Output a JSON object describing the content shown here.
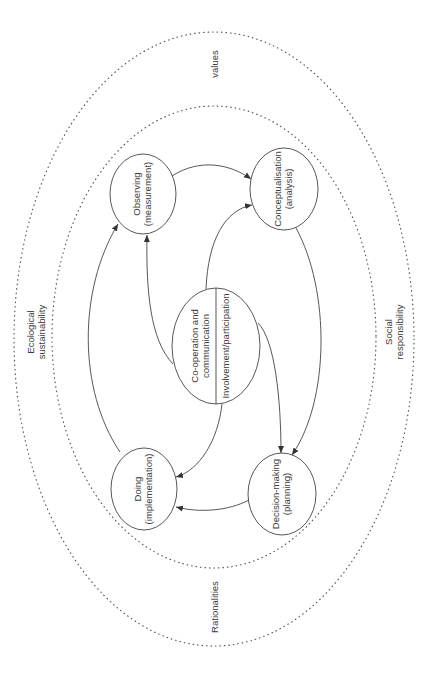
{
  "diagram": {
    "orientation": "rotated -90deg (text reads bottom-to-top)",
    "colors": {
      "background": "#ffffff",
      "stroke": "#444444",
      "text": "#3a3a3a",
      "dotted": "#555555"
    },
    "outer_regions": {
      "top": "values",
      "bottom": "Rationalities",
      "left": {
        "line1": "Ecological",
        "line2": "sustainability"
      },
      "right": {
        "line1": "Social",
        "line2": "responsibility"
      }
    },
    "nodes": {
      "observing": {
        "line1": "Observing",
        "line2": "(measurement)"
      },
      "conceptualisation": {
        "line1": "Conceptualisation",
        "line2": "(analysis)"
      },
      "decision": {
        "line1": "Decision-making",
        "line2": "(planning)"
      },
      "doing": {
        "line1": "Doing",
        "line2": "(implementation)"
      },
      "center": {
        "left_line1": "Co-operation and",
        "left_line2": "communication",
        "right_line": "Involvement/participation"
      }
    },
    "edges": [
      {
        "from": "Observing (measurement)",
        "to": "Conceptualisation (analysis)"
      },
      {
        "from": "Conceptualisation (analysis)",
        "to": "Decision-making (planning)"
      },
      {
        "from": "Decision-making (planning)",
        "to": "Doing (implementation)"
      },
      {
        "from": "Doing (implementation)",
        "to": "Observing (measurement)"
      },
      {
        "from": "Co-operation and communication",
        "to": "Observing (measurement)"
      },
      {
        "from": "Co-operation and communication",
        "to": "Conceptualisation (analysis)"
      },
      {
        "from": "Involvement/participation",
        "to": "Decision-making (planning)"
      },
      {
        "from": "Involvement/participation",
        "to": "Doing (implementation)"
      }
    ]
  }
}
